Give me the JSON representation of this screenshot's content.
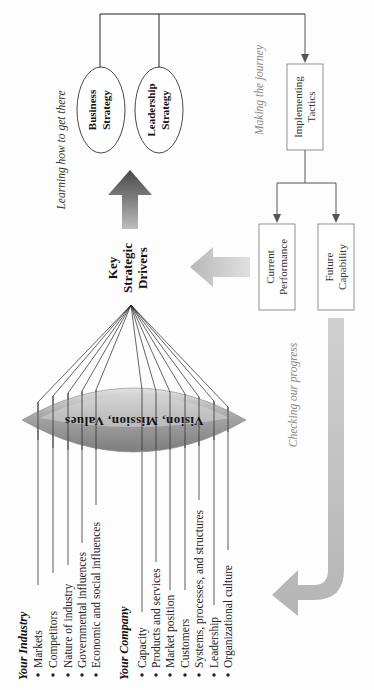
{
  "diagram": {
    "orientation": "page rotated 90 degrees counter-clockwise",
    "industry": {
      "heading": "Your Industry",
      "items": [
        "Markets",
        "Competitors",
        "Nature of industry",
        "Governmental influences",
        "Economic and social influences"
      ]
    },
    "company": {
      "heading": "Your Company",
      "items": [
        "Capacity",
        "Products and services",
        "Market position",
        "Customers",
        "Systems, processes, and structures",
        "Leadership",
        "Organizational culture"
      ]
    },
    "lens": {
      "label": "Vision, Mission, Values"
    },
    "key_drivers": {
      "lines": [
        "Key",
        "Strategic",
        "Drivers"
      ]
    },
    "strategies": [
      {
        "lines": [
          "Business",
          "Strategy"
        ]
      },
      {
        "lines": [
          "Leadership",
          "Strategy"
        ]
      }
    ],
    "implementing": {
      "lines": [
        "Implementing",
        "Tactics"
      ]
    },
    "current": {
      "lines": [
        "Current",
        "Performance"
      ]
    },
    "future": {
      "lines": [
        "Future",
        "Capability"
      ]
    },
    "captions": {
      "learning": "Learning how to get there",
      "making": "Making the journey",
      "checking": "Checking our progress"
    },
    "colors": {
      "line": "#222222",
      "arrow_dark": "#555555",
      "arrow_light": "#bdbdbd",
      "lens_dark": "#8a8a8a",
      "lens_light": "#e6e6e6",
      "box_border": "#777777"
    }
  }
}
